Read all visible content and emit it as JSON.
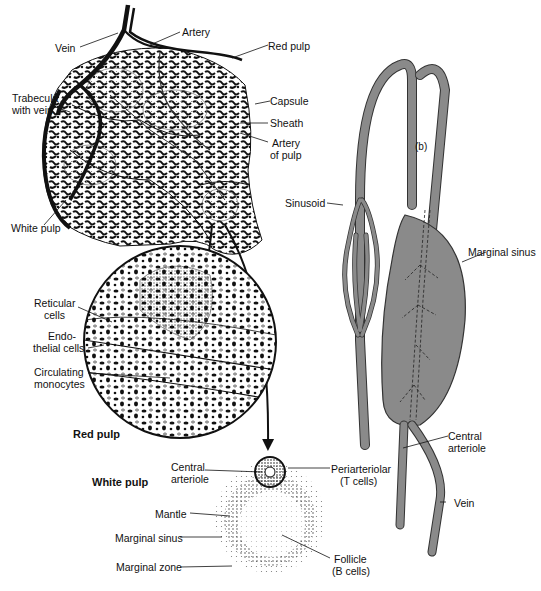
{
  "figure": {
    "panel_a": {
      "tag": "(a)",
      "labels": {
        "vein": "Vein",
        "artery": "Artery",
        "red_pulp": "Red pulp",
        "trabecula_line1": "Trabecula",
        "trabecula_line2": "with vein",
        "capsule": "Capsule",
        "sheath": "Sheath",
        "artery_pulp_line1": "Artery",
        "artery_pulp_line2": "of pulp",
        "white_pulp": "White pulp"
      }
    },
    "red_pulp_detail": {
      "title": "Red pulp",
      "labels": {
        "reticular_line1": "Reticular",
        "reticular_line2": "cells",
        "endo_line1": "Endo-",
        "endo_line2": "thelial cells",
        "circ_line1": "Circulating",
        "circ_line2": "monocytes"
      }
    },
    "white_pulp_detail": {
      "title": "White pulp",
      "labels": {
        "central_line1": "Central",
        "central_line2": "arteriole",
        "peri_line1": "Periarteriolar",
        "peri_line2": "(T cells)",
        "mantle": "Mantle",
        "marginal_sinus": "Marginal sinus",
        "marginal_zone": "Marginal zone",
        "follicle_line1": "Follicle",
        "follicle_line2": "(B cells)"
      }
    },
    "panel_b": {
      "tag": "(b)",
      "labels": {
        "sinusoid": "Sinusoid",
        "marginal_sinus": "Marginal sinus",
        "central_line1": "Central",
        "central_line2": "arteriole",
        "vein": "Vein"
      }
    },
    "colors": {
      "ink": "#111111",
      "vessel_gray": "#8a8a8a",
      "stipple": "#b5b5b5"
    }
  }
}
